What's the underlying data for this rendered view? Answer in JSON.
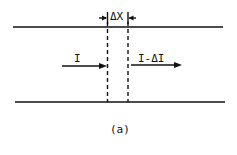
{
  "diagram": {
    "width_label": "ΔX",
    "input_label": "I",
    "output_label": "I-ΔI",
    "caption": "(a)"
  }
}
